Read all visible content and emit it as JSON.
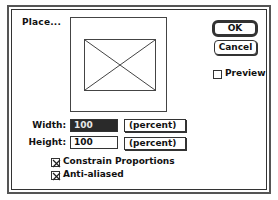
{
  "dialog": {
    "title": "Place...",
    "buttons": {
      "ok": "OK",
      "cancel": "Cancel"
    },
    "preview_checkbox": {
      "label": "Preview",
      "checked": false
    },
    "fields": {
      "width": {
        "label": "Width:",
        "value": "100",
        "unit": "(percent)",
        "selected": true
      },
      "height": {
        "label": "Height:",
        "value": "100",
        "unit": "(percent)",
        "selected": false
      }
    },
    "options": {
      "constrain_proportions": {
        "label": "Constrain Proportions",
        "checked": true
      },
      "anti_aliased": {
        "label": "Anti-aliased",
        "checked": true
      }
    },
    "preview_placeholder_icon": "image-placeholder-icon"
  }
}
